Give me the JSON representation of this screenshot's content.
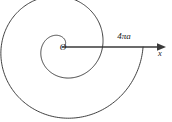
{
  "figure": {
    "background_color": "#ffffff",
    "stroke_color": "#2b2b2b",
    "axis_color": "#3a3a3a",
    "text_color": "#1a1a1a",
    "origin_label": "O",
    "axis_label": "x",
    "measure_label": "4πa",
    "measure_number": "4",
    "measure_symbol": "πa"
  },
  "chart_data": {
    "type": "line",
    "title": "",
    "subtitle": "",
    "xlabel": "x",
    "ylabel": "",
    "grid": false,
    "legend": "none",
    "curve_equation": "r = aθ",
    "curve_name": "Archimedean spiral",
    "theta_range_label": "0 to 4π",
    "annotations": [
      {
        "text": "O",
        "role": "origin-label",
        "x": 63,
        "y": 50
      },
      {
        "text": "4πa",
        "role": "segment-length-label",
        "x": 124,
        "y": 39
      },
      {
        "text": "x",
        "role": "axis-name-label",
        "x": 160,
        "y": 56
      }
    ],
    "axis": {
      "x_start": [
        62,
        47
      ],
      "x_end": [
        166,
        47
      ],
      "arrowhead": true
    },
    "spiral": {
      "center": [
        62,
        47
      ],
      "turns": 2,
      "theta_start": 0,
      "theta_end": 12.566,
      "a_pixels": 6.45,
      "end_radius_pixels": 81,
      "rotation_degrees": 0,
      "direction": "counterclockwise",
      "extent_left_x": 13,
      "extent_bottom_y": 108,
      "extent_top_y": 0,
      "extent_right_x": 143
    }
  }
}
